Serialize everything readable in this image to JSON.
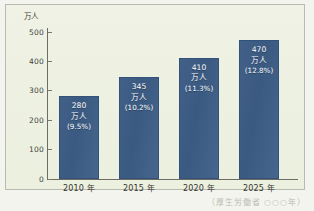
{
  "chart_data": {
    "type": "bar",
    "title": "",
    "xlabel": "",
    "ylabel": "万人",
    "ylim": [
      0,
      500
    ],
    "yticks": [
      "0",
      "100",
      "200",
      "300",
      "400",
      "500"
    ],
    "grid": false,
    "legend": "none",
    "categories": [
      "2010 年",
      "2015 年",
      "2020 年",
      "2025 年"
    ],
    "values": [
      280,
      345,
      410,
      470
    ],
    "percents": [
      "(9.5%)",
      "(10.2%)",
      "(11.3%)",
      "(12.8%)"
    ],
    "unit_suffix": "万人",
    "bars": [
      {
        "category": "2010 年",
        "value": 280,
        "value_label": "280",
        "unit": "万人",
        "percent": "(9.5%)"
      },
      {
        "category": "2015 年",
        "value": 345,
        "value_label": "345",
        "unit": "万人",
        "percent": "(10.2%)"
      },
      {
        "category": "2020 年",
        "value": 410,
        "value_label": "410",
        "unit": "万人",
        "percent": "(11.3%)"
      },
      {
        "category": "2025 年",
        "value": 470,
        "value_label": "470",
        "unit": "万人",
        "percent": "(12.8%)"
      }
    ],
    "colors": {
      "bar": "#3a5a82",
      "bar_border": "#33527a",
      "plot_background": "#eef2e2",
      "page_background": "#f4f4ee",
      "axis": "#6d6d66",
      "tick_text": "#43433e",
      "bar_text": "#ffffff",
      "frame_border": "#b9bab0"
    }
  },
  "caption": {
    "text": "（厚生労働省  ○○○年）"
  }
}
